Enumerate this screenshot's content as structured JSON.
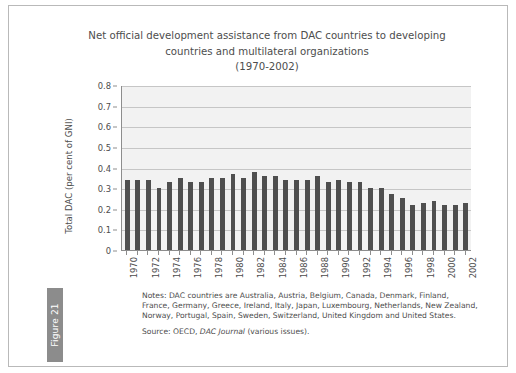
{
  "figure": {
    "tab_label": "Figure 21"
  },
  "chart_data": {
    "type": "bar",
    "title": "Net official development assistance from DAC countries to developing countries and multilateral organizations (1970-2002)",
    "title_lines": [
      "Net official development assistance from DAC countries to developing",
      "countries and multilateral organizations",
      "(1970-2002)"
    ],
    "xlabel": "",
    "ylabel": "Total DAC (per cent of GNI)",
    "ylim": [
      0,
      0.8
    ],
    "ytick_labels": [
      "0.8",
      "0.7",
      "0.6",
      "0.5",
      "0.4",
      "0.3",
      "0.2",
      "0.1",
      "0"
    ],
    "ytick_values": [
      0.8,
      0.7,
      0.6,
      0.5,
      0.4,
      0.3,
      0.2,
      0.1,
      0
    ],
    "grid": true,
    "legend": "none",
    "bar_color": "#4f4f4f",
    "plot_background": "#f2f2f2",
    "xtick_label_step": 2,
    "categories": [
      "1970",
      "1971",
      "1972",
      "1973",
      "1974",
      "1975",
      "1976",
      "1977",
      "1978",
      "1979",
      "1980",
      "1981",
      "1982",
      "1983",
      "1984",
      "1985",
      "1986",
      "1987",
      "1988",
      "1989",
      "1990",
      "1991",
      "1992",
      "1993",
      "1994",
      "1995",
      "1996",
      "1997",
      "1998",
      "1999",
      "2000",
      "2001",
      "2002"
    ],
    "values": [
      0.34,
      0.34,
      0.34,
      0.3,
      0.33,
      0.35,
      0.33,
      0.33,
      0.35,
      0.35,
      0.37,
      0.35,
      0.38,
      0.36,
      0.36,
      0.34,
      0.34,
      0.34,
      0.36,
      0.33,
      0.34,
      0.33,
      0.33,
      0.3,
      0.3,
      0.27,
      0.25,
      0.22,
      0.23,
      0.24,
      0.22,
      0.22,
      0.23
    ]
  },
  "notes": {
    "lines": [
      "Notes: DAC countries are Australia, Austria, Belgium, Canada, Denmark, Finland,",
      "France, Germany, Greece, Ireland, Italy, Japan, Luxembourg, Netherlands, New Zealand,",
      "Norway, Portugal, Spain, Sweden, Switzerland, United Kingdom and United States."
    ]
  },
  "source": {
    "prefix": "Source: OECD, ",
    "journal": "DAC Journal",
    "suffix": " (various issues)."
  }
}
